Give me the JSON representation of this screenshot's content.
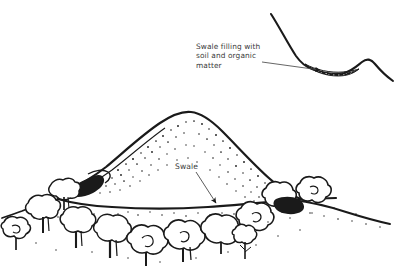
{
  "figure": {
    "name": "swale-illustration",
    "background_color": "#ffffff",
    "ink_color": "#1a1a1a",
    "text_color": "#3a3a3a"
  },
  "inset": {
    "name": "cross-section-inset",
    "caption": "Swale filling with\nsoil and organic\nmatter",
    "caption_line_1": "Swale filling with",
    "caption_line_2": "soil and organic",
    "caption_line_3": "matter",
    "leader_from": [
      262,
      62
    ],
    "leader_to": [
      322,
      71
    ],
    "fill_hatch_color": "#1a1a1a"
  },
  "main": {
    "name": "main-landscape",
    "swale_label": "Swale",
    "swale_arrow_from": [
      196,
      172
    ],
    "swale_arrow_to": [
      218,
      205
    ],
    "hill_peak": [
      190,
      112
    ],
    "ground_line_y": 207
  }
}
